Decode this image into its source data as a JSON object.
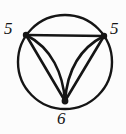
{
  "figure": {
    "kind": "graph-diagram",
    "background_color": "#fcfcfc",
    "stroke_color": "#151515",
    "width": 126,
    "height": 134,
    "circle": {
      "center_x": 65,
      "center_y": 62,
      "radius": 47,
      "stroke_width": 2.4
    },
    "vertices": [
      {
        "id": "left",
        "label": "5",
        "x": 26,
        "y": 35,
        "dot_radius": 3.2
      },
      {
        "id": "right",
        "label": "5",
        "x": 104,
        "y": 36,
        "dot_radius": 3.2
      },
      {
        "id": "bottom",
        "label": "6",
        "x": 65,
        "y": 101,
        "dot_radius": 3.4
      }
    ],
    "edges": [
      {
        "id": "chord-left-right",
        "from": "left",
        "to": "right",
        "style": "straight"
      },
      {
        "id": "left-bottom-straight",
        "from": "left",
        "to": "bottom",
        "style": "straight"
      },
      {
        "id": "left-bottom-curved",
        "from": "left",
        "to": "bottom",
        "style": "curved"
      },
      {
        "id": "right-bottom-straight",
        "from": "right",
        "to": "bottom",
        "style": "straight"
      },
      {
        "id": "right-bottom-curved",
        "from": "right",
        "to": "bottom",
        "style": "curved"
      }
    ],
    "labels": {
      "left": "5",
      "right": "5",
      "bottom": "6"
    }
  }
}
